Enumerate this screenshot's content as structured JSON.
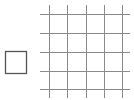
{
  "diagram": {
    "square": {
      "x": 5,
      "y": 51,
      "width": 21,
      "height": 22,
      "stroke": "#555555",
      "stroke_width": 1.3
    },
    "grid": {
      "stroke": "#8a8a8a",
      "stroke_width": 1,
      "vertical_lines_x": [
        49,
        67,
        86,
        104,
        122
      ],
      "vertical_span": [
        5,
        98
      ],
      "horizontal_lines_y": [
        14,
        33,
        52,
        71,
        89
      ],
      "horizontal_span": [
        40,
        130
      ]
    }
  }
}
